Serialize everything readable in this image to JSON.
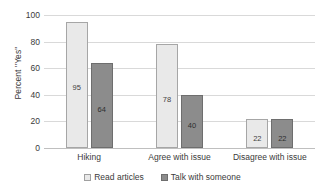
{
  "chart_data": {
    "type": "bar",
    "title": "",
    "xlabel": "",
    "ylabel": "Percent \"Yes\"",
    "ylim": [
      0,
      100
    ],
    "yticks": [
      0,
      20,
      40,
      60,
      80,
      100
    ],
    "ytick_labels": [
      "0",
      "20",
      "40",
      "60",
      "80",
      "100"
    ],
    "grid": true,
    "legend_position": "bottom",
    "categories": [
      "Hiking",
      "Agree with issue",
      "Disagree with issue"
    ],
    "series": [
      {
        "name": "Read articles",
        "color": "#e9e9e9",
        "border_color": "#a6a6a6",
        "values": [
          95,
          78,
          22
        ],
        "value_labels": [
          "95",
          "78",
          "22"
        ]
      },
      {
        "name": "Talk with someone",
        "color": "#8c8c8c",
        "border_color": "#6e6e6e",
        "values": [
          64,
          40,
          22
        ],
        "value_labels": [
          "64",
          "40",
          "22"
        ]
      }
    ]
  }
}
